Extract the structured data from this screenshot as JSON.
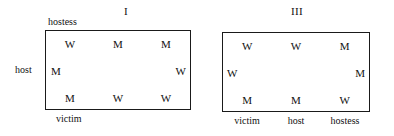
{
  "figure": {
    "background_color": "#ffffff",
    "border_color": "#1a1a1a",
    "text_color": "#111111",
    "panels": [
      {
        "id": "panel-1",
        "title": "I",
        "top_label": "hostess",
        "left_label": "host",
        "bottom_labels": [
          "victim"
        ],
        "grid": {
          "rows": 3,
          "cols": 3,
          "cells": [
            [
              "W",
              "M",
              "M"
            ],
            [
              "M",
              "",
              "W"
            ],
            [
              "M",
              "W",
              "W"
            ]
          ]
        }
      },
      {
        "id": "panel-3",
        "title": "III",
        "top_label": "",
        "left_label": "",
        "bottom_labels": [
          "victim",
          "host",
          "hostess"
        ],
        "grid": {
          "rows": 3,
          "cols": 3,
          "cells": [
            [
              "W",
              "W",
              "M"
            ],
            [
              "W",
              "",
              "M"
            ],
            [
              "M",
              "M",
              "W"
            ]
          ]
        }
      }
    ]
  }
}
